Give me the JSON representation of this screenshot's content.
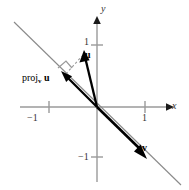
{
  "figure": {
    "axes": {
      "x_label": "x",
      "y_label": "y",
      "ticks": {
        "x_positive": "1",
        "x_negative": "−1",
        "y_positive": "1",
        "y_negative": "−1"
      },
      "axis_color": "#999999",
      "axis_arrow_color": "#1a1a1a"
    },
    "labels": {
      "vector_u": "u",
      "vector_v": "v",
      "projection_prefix": "proj",
      "projection_subscript": "v",
      "projection_operand": "u"
    },
    "colors": {
      "vector": "#000000",
      "support_line": "#8a8a8a",
      "dashed_line": "#9a9a9a",
      "right_angle": "#9a9a9a"
    },
    "geometry": {
      "origin": [
        97,
        107
      ],
      "unit_px": 48,
      "u_tip": [
        84,
        52
      ],
      "v_tip": [
        145,
        157
      ],
      "proj_tip": [
        62,
        80
      ],
      "line_start": [
        14,
        22
      ],
      "line_end": [
        181,
        185
      ]
    }
  }
}
